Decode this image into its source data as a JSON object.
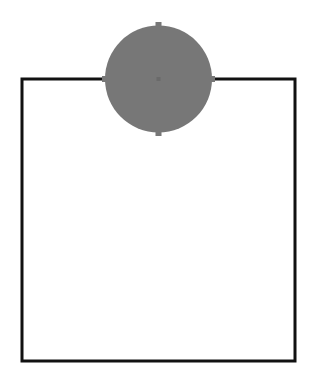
{
  "diagram": {
    "background": "#ffffff",
    "square": {
      "x": 22,
      "y": 79,
      "width": 273,
      "height": 282,
      "stroke": "#111111",
      "stroke_width": 3,
      "fill": "#ffffff"
    },
    "circle": {
      "cx": 158.5,
      "cy": 79,
      "r": 53.5,
      "fill": "#777777",
      "center_dot_color": "#6a6a6a",
      "tick_marks": [
        "top",
        "bottom",
        "left",
        "right"
      ]
    }
  }
}
